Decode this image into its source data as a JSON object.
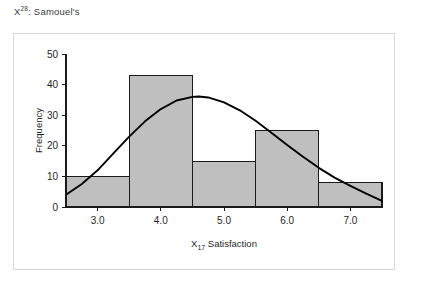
{
  "title": {
    "prefix": "X",
    "superscript": "28",
    "suffix": ": Samouel's",
    "full": "X28: Samouel's"
  },
  "colors": {
    "bar_fill": "#bfbfbf",
    "bar_stroke": "#1a1a1a",
    "curve": "#000000",
    "axis": "#1a1a1a",
    "outer_border": "#d8d8d8",
    "plot_background": "#ffffff",
    "title_text": "#3c3c3c"
  },
  "chart_data": {
    "type": "bar",
    "title": "X28: Samouel's",
    "xlabel": "X17 Satisfaction",
    "xlabel_base": "X",
    "xlabel_sub": "17",
    "xlabel_rest": " Satisfaction",
    "ylabel": "Frequency",
    "categories": [
      "3.0",
      "4.0",
      "5.0",
      "6.0",
      "7.0"
    ],
    "bin_edges": [
      2.5,
      3.5,
      4.5,
      5.5,
      6.5,
      7.5
    ],
    "bin_centers": [
      3.0,
      4.0,
      5.0,
      6.0,
      7.0
    ],
    "values": [
      10,
      43,
      15,
      25,
      8
    ],
    "xlim": [
      2.5,
      7.5
    ],
    "ylim": [
      0,
      50
    ],
    "ytick_values": [
      0,
      10,
      20,
      30,
      40,
      50
    ],
    "ytick_labels": [
      "0",
      "10",
      "20",
      "30",
      "40",
      "50"
    ],
    "xtick_values": [
      3.0,
      4.0,
      5.0,
      6.0,
      7.0
    ],
    "xtick_labels": [
      "3.0",
      "4.0",
      "5.0",
      "6.0",
      "7.0"
    ],
    "grid": false,
    "legend": "none",
    "overlay": {
      "type": "line",
      "name": "normal curve",
      "x": [
        2.5,
        2.75,
        3.0,
        3.25,
        3.5,
        3.75,
        4.0,
        4.25,
        4.5,
        4.6,
        4.75,
        5.0,
        5.25,
        5.5,
        5.75,
        6.0,
        6.25,
        6.5,
        6.75,
        7.0,
        7.25,
        7.5
      ],
      "y": [
        4.0,
        7.5,
        12.0,
        17.5,
        23.0,
        28.0,
        32.0,
        34.8,
        36.0,
        36.1,
        35.8,
        34.2,
        31.6,
        28.2,
        24.3,
        20.3,
        16.4,
        12.8,
        9.6,
        6.9,
        4.4,
        2.0
      ]
    }
  }
}
